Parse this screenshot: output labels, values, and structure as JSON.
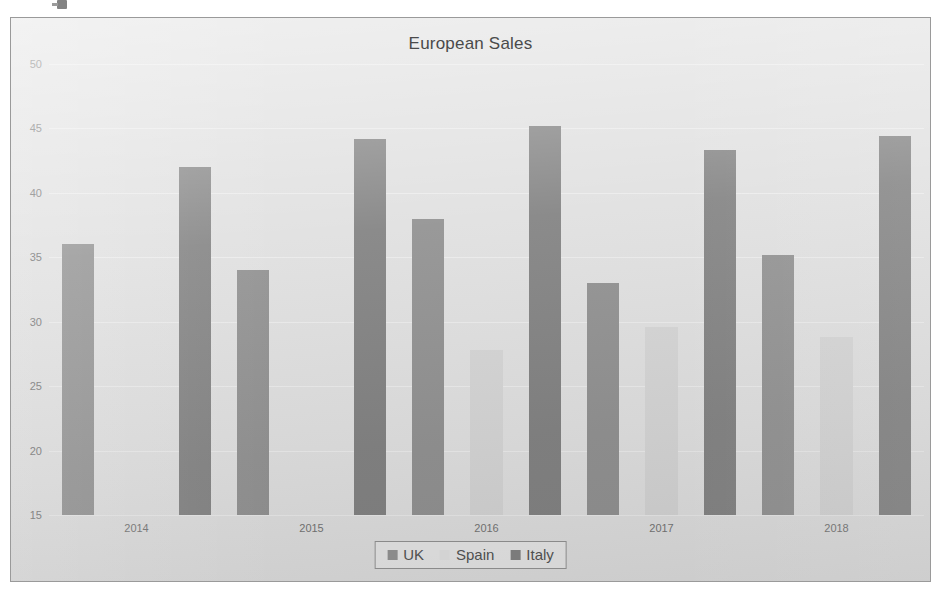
{
  "chart_data": {
    "type": "bar",
    "title": "European Sales",
    "xlabel": "",
    "ylabel": "",
    "categories": [
      "2014",
      "2015",
      "2016",
      "2017",
      "2018"
    ],
    "series": [
      {
        "name": "UK",
        "color": "#8b8b8b",
        "values": [
          36.0,
          34.0,
          38.0,
          33.0,
          35.2
        ]
      },
      {
        "name": "Spain",
        "color": "#d3d3d3",
        "values": [
          12.0,
          13.0,
          27.8,
          29.6,
          28.8
        ]
      },
      {
        "name": "Italy",
        "color": "#7b7b7b",
        "values": [
          42.0,
          44.2,
          45.2,
          43.3,
          44.4
        ]
      }
    ],
    "ylim": [
      15,
      50
    ],
    "ytick_step": 5,
    "yticks": [
      "50",
      "45",
      "40",
      "35",
      "30",
      "25",
      "20",
      "15"
    ],
    "grid": true,
    "legend_position": "bottom-center",
    "legend_entries": [
      "UK",
      "Spain",
      "Italy"
    ],
    "plot_background": "#dedede",
    "gridline_color": "#ebebeb",
    "text_color": "#6b6b6b"
  }
}
